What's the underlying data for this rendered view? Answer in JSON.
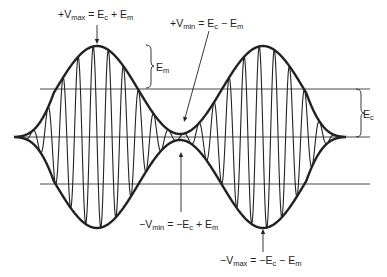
{
  "diagram": {
    "colors": {
      "stroke": "#222222",
      "background": "#ffffff"
    },
    "geometry": {
      "x_start": 14,
      "x_end": 346,
      "center_y": 137,
      "top_ref_y": 89,
      "bottom_ref_y": 184,
      "ref_line_x0": 40,
      "ref_line_x1": 370,
      "Ec_px": 47,
      "Em_px": 44,
      "carrier_cycles": 22,
      "modulation_cycles": 2
    },
    "labels": {
      "vmax_pos": {
        "prefix": "+V",
        "sub": "max",
        "eq": " = E",
        "sub2": "c",
        "tail": " + E",
        "sub3": "m"
      },
      "vmin_pos": {
        "prefix": "+V",
        "sub": "min",
        "eq": " = E",
        "sub2": "c",
        "tail": " − E",
        "sub3": "m"
      },
      "em": {
        "prefix": "E",
        "sub": "m"
      },
      "ec": {
        "prefix": "E",
        "sub": "c"
      },
      "vmin_neg": {
        "prefix": "−V",
        "sub": "min",
        "eq": " = −E",
        "sub2": "c",
        "tail": " + E",
        "sub3": "m"
      },
      "vmax_neg": {
        "prefix": "−V",
        "sub": "max",
        "eq": " = −E",
        "sub2": "c",
        "tail": " − E",
        "sub3": "m"
      }
    }
  }
}
